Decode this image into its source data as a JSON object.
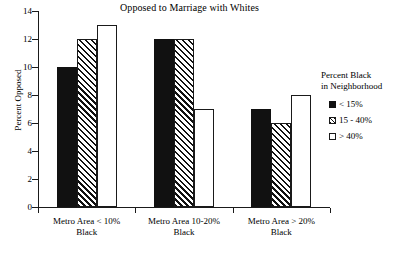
{
  "chart_data": {
    "type": "bar",
    "title": "Opposed to Marriage with Whites",
    "xlabel": "",
    "ylabel": "Percent Opposed",
    "ylim": [
      0,
      14
    ],
    "yticks": [
      0,
      2,
      4,
      6,
      8,
      10,
      12,
      14
    ],
    "ytick_labels": [
      "0",
      "2",
      "4",
      "6",
      "8",
      "10",
      "12",
      "14"
    ],
    "grid": false,
    "legend_position": "right",
    "legend_title": "Percent Black in Neighborhood",
    "legend_title_line1": "Percent Black",
    "legend_title_line2": "in Neighborhood",
    "categories": [
      "Metro Area < 10% Black",
      "Metro Area 10-20% Black",
      "Metro Area > 20% Black"
    ],
    "category_lines": [
      [
        "Metro Area < 10%",
        "Black"
      ],
      [
        "Metro Area 10-20%",
        "Black"
      ],
      [
        "Metro Area > 20%",
        "Black"
      ]
    ],
    "series": [
      {
        "name": "< 15%",
        "fill": "solid",
        "values": [
          10,
          12,
          7
        ]
      },
      {
        "name": "15 - 40%",
        "fill": "hatched",
        "values": [
          12,
          12,
          6
        ]
      },
      {
        "name": "> 40%",
        "fill": "open",
        "values": [
          13,
          7,
          8
        ]
      }
    ],
    "colors": {
      "axis": "#1a1a1a",
      "bar_solid": "#111111",
      "bar_outline": "#1a1a1a",
      "background": "#ffffff"
    }
  }
}
